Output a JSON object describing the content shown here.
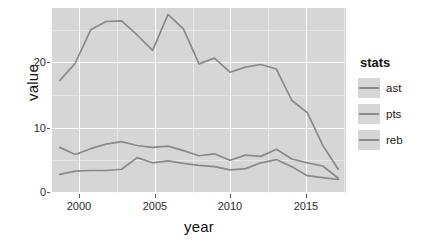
{
  "chart_data": {
    "type": "line",
    "title": "",
    "xlabel": "year",
    "ylabel": "value",
    "xlim": [
      1998.5,
      2017.5
    ],
    "ylim": [
      -0.6,
      28.2
    ],
    "xticks": [
      2000,
      2005,
      2010,
      2015
    ],
    "yticks": [
      0,
      10,
      20
    ],
    "grid": true,
    "legend_title": "stats",
    "legend_position": "right",
    "x": [
      1999,
      2000,
      2001,
      2002,
      2003,
      2004,
      2005,
      2006,
      2007,
      2008,
      2009,
      2010,
      2011,
      2012,
      2013,
      2014,
      2015,
      2016,
      2017
    ],
    "series": [
      {
        "name": "ast",
        "color": "#8a8a8a",
        "values": [
          2.3,
          2.8,
          2.9,
          2.9,
          3.1,
          4.9,
          4.1,
          4.4,
          4.0,
          3.7,
          3.5,
          3.0,
          3.2,
          4.1,
          4.6,
          3.5,
          2.1,
          1.8,
          1.5
        ]
      },
      {
        "name": "pts",
        "color": "#8a8a8a",
        "values": [
          16.9,
          19.6,
          24.8,
          26.1,
          26.2,
          24.0,
          21.6,
          27.2,
          24.9,
          19.5,
          20.4,
          18.2,
          19.0,
          19.4,
          18.7,
          13.8,
          11.9,
          6.8,
          3.1
        ]
      },
      {
        "name": "reb",
        "color": "#8a8a8a",
        "values": [
          6.5,
          5.4,
          6.3,
          7.0,
          7.4,
          6.8,
          6.5,
          6.7,
          6.0,
          5.2,
          5.5,
          4.5,
          5.3,
          5.1,
          6.2,
          4.7,
          4.1,
          3.6,
          1.7
        ]
      }
    ]
  },
  "axis": {
    "y_title": "value",
    "x_title": "year",
    "y_tick_labels": [
      "0",
      "10",
      "20"
    ],
    "x_tick_labels": [
      "2000",
      "2005",
      "2010",
      "2015"
    ]
  },
  "legend": {
    "title": "stats",
    "items": [
      {
        "label": "ast",
        "color": "#8a8a8a"
      },
      {
        "label": "pts",
        "color": "#8a8a8a"
      },
      {
        "label": "reb",
        "color": "#8a8a8a"
      }
    ]
  },
  "style": {
    "panel_bg": "#d6d6d6",
    "grid_major": "#ffffff",
    "grid_minor": "#e7e7e7",
    "figure_bg": "#ffffff"
  }
}
